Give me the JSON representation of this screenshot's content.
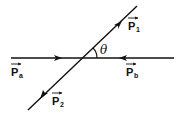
{
  "diagram": {
    "title": "",
    "vectors": [
      {
        "id": "Pa",
        "base": "P",
        "subscript": "a",
        "direction": "right"
      },
      {
        "id": "Pb",
        "base": "P",
        "subscript": "b",
        "direction": "left"
      },
      {
        "id": "P1",
        "base": "P",
        "subscript": "1",
        "direction": "up-right"
      },
      {
        "id": "P2",
        "base": "P",
        "subscript": "2",
        "direction": "down-left"
      }
    ],
    "angle_label": "θ",
    "line_color": "#111111"
  }
}
